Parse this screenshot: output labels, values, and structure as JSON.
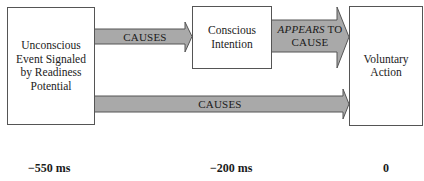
{
  "diagram": {
    "boxes": {
      "unconscious": "Unconscious Event Signaled by Readiness Potential",
      "conscious": "Conscious Intention",
      "action": "Voluntary Action"
    },
    "arrows": {
      "top_left": "CAUSES",
      "top_right_italic": "APPEARS",
      "top_right_rest": " TO CAUSE",
      "bottom": "CAUSES"
    },
    "arrow_fill": "#a9a9a9",
    "arrow_stroke": "#555555",
    "timeline": [
      "−550 ms",
      "−200 ms",
      "0"
    ]
  }
}
